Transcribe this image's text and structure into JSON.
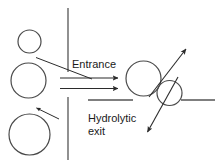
{
  "diagram": {
    "type": "schematic",
    "title_visible": false,
    "background_color": "#ffffff",
    "stroke_color": "#333333",
    "text_color": "#1a1a1a",
    "labels": {
      "entrance": "Entrance",
      "hydrolytic_line1": "Hydrolytic",
      "hydrolytic_line2": "exit"
    },
    "shapes": {
      "circle_top_left": {
        "cx": 29.5,
        "cy": 41.5,
        "r": 11.5
      },
      "circle_mid_left": {
        "cx": 28.5,
        "cy": 80.5,
        "r": 17.5
      },
      "circle_bottom_left": {
        "cx": 29.5,
        "cy": 134.5,
        "r": 20.5
      },
      "circle_right_large": {
        "cx": 143.5,
        "cy": 78.5,
        "r": 17.5
      },
      "circle_right_small": {
        "cx": 169.5,
        "cy": 93.0,
        "r": 12.5
      }
    },
    "lines": {
      "wall_vertical_upper": {
        "x1": 68,
        "y1": 8,
        "x2": 68,
        "y2": 72
      },
      "wall_vertical_lower": {
        "x1": 68,
        "y1": 97,
        "x2": 68,
        "y2": 160
      },
      "wall_horizontal_left": {
        "x1": 88,
        "y1": 100,
        "x2": 132,
        "y2": 100
      },
      "wall_horizontal_right": {
        "x1": 181,
        "y1": 100,
        "x2": 215,
        "y2": 100
      }
    },
    "arrows": {
      "entrance_upper": {
        "x1": 60,
        "y1": 78,
        "x2": 120,
        "y2": 78,
        "label": "entrance-arrow-upper"
      },
      "entrance_lower": {
        "x1": 60,
        "y1": 88,
        "x2": 120,
        "y2": 88,
        "label": "entrance-arrow-lower"
      },
      "feed_from_top_circle": {
        "x1": 36,
        "y1": 57,
        "x2": 90,
        "y2": 78,
        "label": "diagonal-feed-arrow"
      },
      "feed_from_bottom_circle": {
        "x1": 57,
        "y1": 118,
        "x2": 36,
        "y2": 108,
        "label": "diagonal-uptake-arrow"
      },
      "exit_up_right": {
        "x1": 150,
        "y1": 96,
        "x2": 187,
        "y2": 48,
        "label": "hydrolytic-exit-arrow-up"
      },
      "exit_down_left": {
        "x1": 178,
        "y1": 78,
        "x2": 148,
        "y2": 133,
        "label": "hydrolytic-exit-arrow-down"
      }
    }
  }
}
